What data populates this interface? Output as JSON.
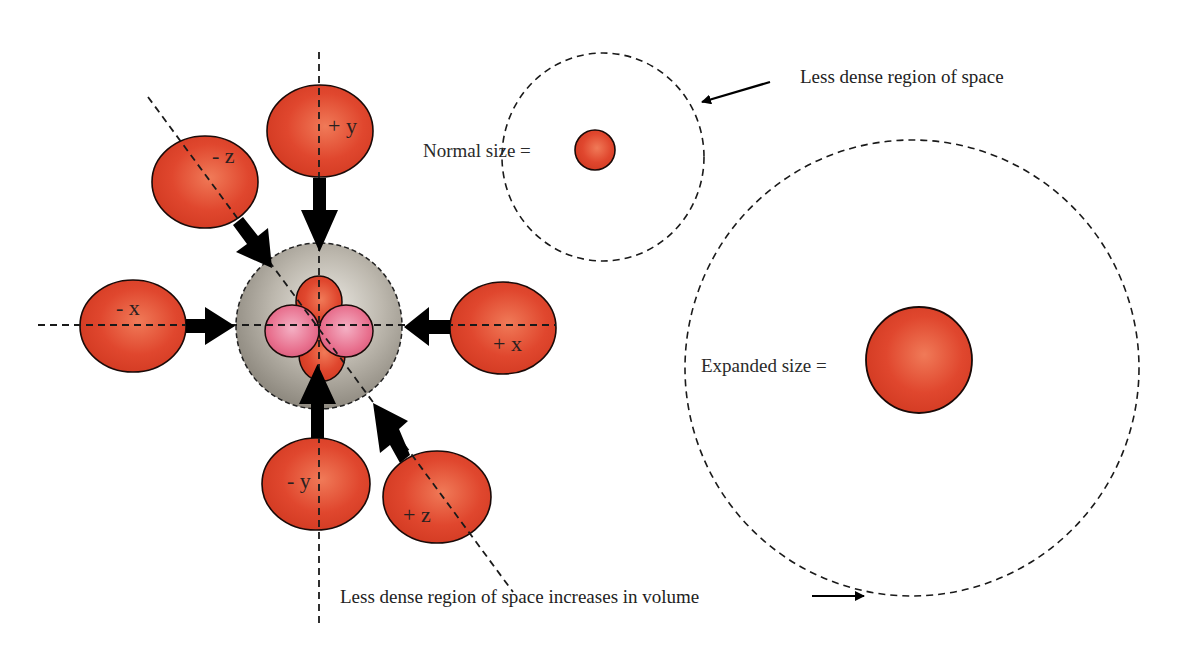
{
  "diagram": {
    "title": "",
    "colors": {
      "ball_fill": "#e0402a",
      "ball_highlight": "#f07a58",
      "ball_stroke": "#1a0a08",
      "inner_lobe_pink": "#e8708e",
      "inner_lobe_pink_highlight": "#f4b0c4",
      "central_sphere": "#a8a398",
      "central_sphere_highlight": "#e2dfd8",
      "arrow": "#000000",
      "dashed_line": "#1a1a1a"
    },
    "balls": [
      {
        "id": "minus-x",
        "label": "- x"
      },
      {
        "id": "plus-x",
        "label": "+ x"
      },
      {
        "id": "plus-y",
        "label": "+ y"
      },
      {
        "id": "minus-y",
        "label": "- y"
      },
      {
        "id": "minus-z",
        "label": "- z"
      },
      {
        "id": "plus-z",
        "label": "+ z"
      }
    ],
    "central_region": {
      "description": "compressed central sphere with four inner lobes (two red, two pink)"
    },
    "normal": {
      "label": "Normal size =",
      "annotation": "Less dense region of space"
    },
    "expanded": {
      "label": "Expanded size =",
      "annotation": "Less dense region of space increases in volume"
    }
  }
}
